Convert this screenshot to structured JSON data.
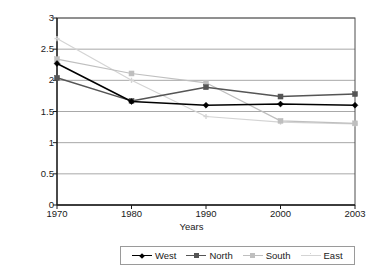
{
  "chart_data": {
    "type": "line",
    "title": "",
    "xlabel": "Years",
    "ylabel": "Total fertility rates",
    "categories": [
      "1970",
      "1980",
      "1990",
      "2000",
      "2003"
    ],
    "ylim": [
      0,
      3
    ],
    "ytick_labels": [
      "0",
      "0.5",
      "1",
      "1.5",
      "2",
      "2.5",
      "3"
    ],
    "ytick_values": [
      0,
      0.5,
      1,
      1.5,
      2,
      2.5,
      3
    ],
    "grid": "horizontal",
    "legend_position": "bottom",
    "series": [
      {
        "name": "West",
        "color": "#000000",
        "marker": "diamond",
        "values": [
          2.27,
          1.66,
          1.6,
          1.62,
          1.6
        ]
      },
      {
        "name": "North",
        "color": "#555555",
        "marker": "square",
        "values": [
          2.04,
          1.67,
          1.89,
          1.74,
          1.78
        ]
      },
      {
        "name": "South",
        "color": "#bfbfbf",
        "marker": "square",
        "values": [
          2.34,
          2.11,
          1.96,
          1.35,
          1.31
        ]
      },
      {
        "name": "East",
        "color": "#d4d4d4",
        "marker": "cross",
        "values": [
          2.67,
          2.0,
          1.42,
          1.33,
          1.3
        ]
      }
    ]
  },
  "axis": {
    "y_title": "Total fertility rates",
    "x_title": "Years"
  },
  "legend": {
    "items": [
      {
        "label": "West"
      },
      {
        "label": "North"
      },
      {
        "label": "South"
      },
      {
        "label": "East"
      }
    ]
  }
}
